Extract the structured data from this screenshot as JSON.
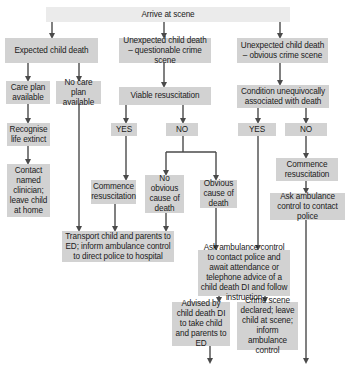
{
  "diagram": {
    "type": "flowchart",
    "colors": {
      "box": "#d2d2d2",
      "top_box": "#ebebeb",
      "arrow": "#4a4a4a"
    },
    "nodes": {
      "arrive": "Arrive at scene",
      "expected": "Expected child death",
      "unexp_question": "Unexpected child death – questionable crime scene",
      "unexp_obvious": "Unexpected child death – obvious crime scene",
      "care_plan": "Care plan available",
      "no_care_plan": "No care plan available",
      "viable_resus": "Viable resuscitation",
      "condition_unequivocal": "Condition unequivocally associated with death",
      "recognise_life_extinct": "Recognise life extinct",
      "yes_mid": "YES",
      "no_mid": "NO",
      "yes_right": "YES",
      "no_right": "NO",
      "commence_resus_right": "Commence resuscitation",
      "contact_clinician": "Contact named clinician; leave child at home",
      "commence_resus_mid": "Commence resuscitation",
      "no_obvious_cause": "No obvious cause of death",
      "obvious_cause": "Obvious cause of death",
      "ask_ambulance_police": "Ask ambulance control to contact police",
      "transport_ed": "Transport child and parents to ED; inform ambulance control to direct police to hospital",
      "ask_ambulance_await": "Ask ambulance control to contact police and await attendance or telephone advice of a child death DI and follow instruction",
      "advised_di": "Advised by child death DI to take child and parents to ED",
      "crime_scene_declared": "Crime scene declared; leave child at scene; inform ambulance control"
    }
  }
}
